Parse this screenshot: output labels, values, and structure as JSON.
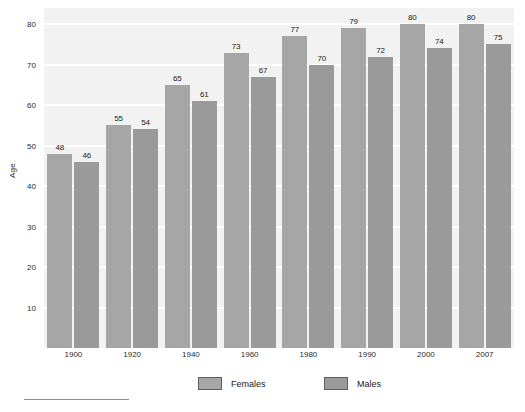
{
  "chart_data": {
    "type": "bar",
    "title": "",
    "xlabel": "",
    "ylabel": "Age",
    "categories": [
      "1900",
      "1920",
      "1940",
      "1960",
      "1980",
      "1990",
      "2000",
      "2007"
    ],
    "series": [
      {
        "name": "Females",
        "values": [
          48,
          55,
          65,
          73,
          77,
          79,
          80,
          80
        ],
        "color": "#a6a6a6"
      },
      {
        "name": "Males",
        "values": [
          46,
          54,
          61,
          67,
          70,
          72,
          74,
          75
        ],
        "color": "#9a9a9a"
      }
    ],
    "ylim": [
      0,
      84
    ],
    "yticks": [
      10,
      20,
      30,
      40,
      50,
      60,
      70,
      80
    ],
    "ytick_labels": [
      "10",
      "20",
      "30",
      "40",
      "50",
      "60",
      "70",
      "80"
    ],
    "grid": true,
    "grid_axis": "y",
    "grid_color": "#ffffff",
    "plot_background": "#f2f2f2",
    "figure_background": "#ffffff",
    "legend_position": "bottom",
    "data_labels": true
  },
  "axis": {
    "y_title": "Age"
  },
  "legend": {
    "items": [
      {
        "label": "Females",
        "color": "#a6a6a6"
      },
      {
        "label": "Males",
        "color": "#9a9a9a"
      }
    ]
  }
}
